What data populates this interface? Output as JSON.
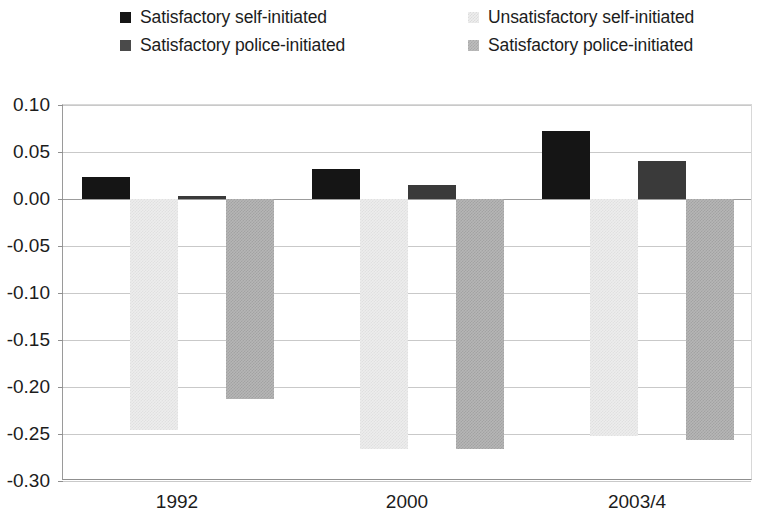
{
  "legend": {
    "entries": [
      {
        "label": "Satisfactory self-initiated",
        "series_key": "s0",
        "color": "#151515"
      },
      {
        "label": "Unsatisfactory self-initiated",
        "series_key": "s1",
        "color": "#ededed"
      },
      {
        "label": "Satisfactory police-initiated",
        "series_key": "s2",
        "color": "#3a3a3a"
      },
      {
        "label": "Satisfactory police-initiated",
        "series_key": "s3",
        "color": "#b6b6b6"
      }
    ]
  },
  "axis": {
    "y_ticks": [
      "0.10",
      "0.05",
      "0.00",
      "-0.05",
      "-0.10",
      "-0.15",
      "-0.20",
      "-0.25",
      "-0.30"
    ],
    "x_ticks": [
      "1992",
      "2000",
      "2003/4"
    ]
  },
  "chart_data": {
    "type": "bar",
    "title": "",
    "xlabel": "",
    "ylabel": "",
    "ylim": [
      -0.3,
      0.1
    ],
    "ytick_step": 0.05,
    "grid": true,
    "legend_position": "top",
    "categories": [
      "1992",
      "2000",
      "2003/4"
    ],
    "series": [
      {
        "name": "Satisfactory self-initiated",
        "color": "#151515",
        "values": [
          0.023,
          0.032,
          0.072
        ]
      },
      {
        "name": "Unsatisfactory self-initiated",
        "color": "#ededed",
        "values": [
          -0.246,
          -0.266,
          -0.252
        ]
      },
      {
        "name": "Satisfactory police-initiated",
        "color": "#3a3a3a",
        "values": [
          0.003,
          0.015,
          0.04
        ]
      },
      {
        "name": "Satisfactory police-initiated",
        "color": "#b6b6b6",
        "values": [
          -0.213,
          -0.266,
          -0.256
        ]
      }
    ]
  }
}
